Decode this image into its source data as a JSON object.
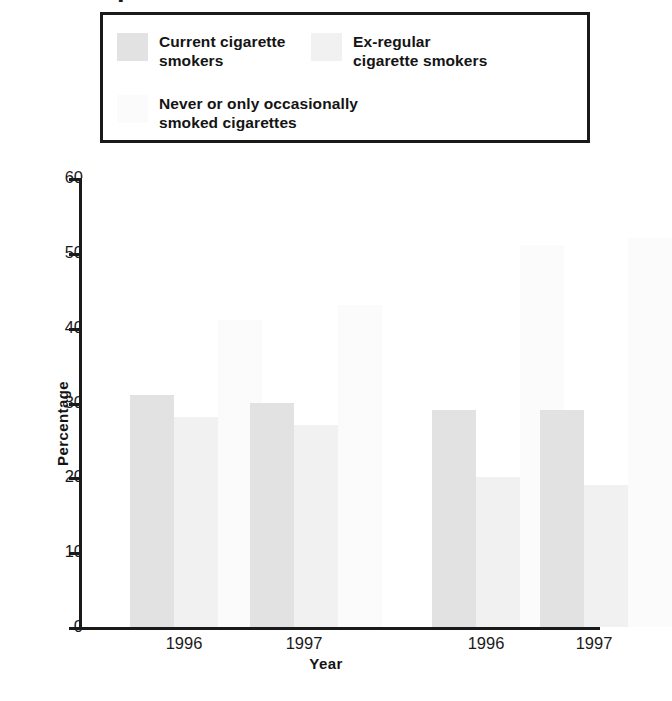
{
  "top_fragment": {
    "text": "▪"
  },
  "legend": {
    "entries": [
      {
        "label": "Current cigarette\nsmokers",
        "color": "#e2e2e2",
        "swatch_name": "legend-swatch-current-smokers"
      },
      {
        "label": "Ex-regular\ncigarette smokers",
        "color": "#f1f1f1",
        "swatch_name": "legend-swatch-ex-regular-smokers"
      },
      {
        "label": "Never or only occasionally\nsmoked cigarettes",
        "color": "#fbfbfb",
        "swatch_name": "legend-swatch-never-smokers"
      }
    ]
  },
  "axes": {
    "y_title": "Percentage",
    "x_title": "Year",
    "y_ticks": [
      "60",
      "50",
      "40",
      "30",
      "20",
      "10",
      "0"
    ],
    "x_tick_labels": [
      "1996",
      "1997",
      "1996",
      "1997"
    ]
  },
  "groups": [
    {
      "title": "Men"
    },
    {
      "title": "Women"
    }
  ],
  "chart_data": {
    "type": "bar",
    "title": "",
    "subtitle": "",
    "xlabel": "Year",
    "ylabel": "Percentage",
    "ylim": [
      0,
      60
    ],
    "yticks": [
      0,
      10,
      20,
      30,
      40,
      50,
      60
    ],
    "grid": false,
    "legend_position": "top",
    "grouping": [
      "Men",
      "Women"
    ],
    "categories": [
      "Men 1996",
      "Men 1997",
      "Women 1996",
      "Women 1997"
    ],
    "series": [
      {
        "name": "Current cigarette smokers",
        "color": "#e2e2e2",
        "values": [
          31,
          30,
          29,
          29
        ]
      },
      {
        "name": "Ex-regular cigarette smokers",
        "color": "#f1f1f1",
        "values": [
          28,
          27,
          20,
          19
        ]
      },
      {
        "name": "Never or only occasionally smoked cigarettes",
        "color": "#fbfbfb",
        "values": [
          41,
          43,
          51,
          52
        ]
      }
    ],
    "annotations": []
  }
}
